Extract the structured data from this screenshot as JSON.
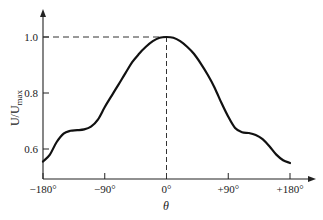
{
  "chart_data": {
    "type": "line",
    "title": "",
    "xlabel": "θ",
    "ylabel": "U/U",
    "ylabel_subscript": "max",
    "xlim": [
      -180,
      180
    ],
    "ylim": [
      0.5,
      1.05
    ],
    "grid": false,
    "legend": null,
    "x_ticks": [
      -180,
      -90,
      0,
      90,
      180
    ],
    "x_tick_labels": [
      "−180°",
      "−90°",
      "0°",
      "+90°",
      "+180°"
    ],
    "y_ticks": [
      0.6,
      0.8,
      1.0
    ],
    "y_tick_labels": [
      "0.6",
      "0.8",
      "1.0"
    ],
    "annotations": [
      {
        "type": "dashed-hline",
        "y": 1.0,
        "from_x": -180,
        "to_x": 0
      },
      {
        "type": "dashed-vline",
        "x": 0,
        "from_y": 0.5,
        "to_y": 1.0
      }
    ],
    "series": [
      {
        "name": "U/Umax",
        "x": [
          -180,
          -170,
          -160,
          -150,
          -140,
          -130,
          -120,
          -110,
          -100,
          -90,
          -80,
          -70,
          -60,
          -50,
          -40,
          -30,
          -20,
          -10,
          0,
          10,
          20,
          30,
          40,
          50,
          60,
          70,
          80,
          90,
          100,
          110,
          120,
          130,
          140,
          150,
          160,
          170,
          180
        ],
        "values": [
          0.555,
          0.58,
          0.625,
          0.655,
          0.665,
          0.667,
          0.67,
          0.68,
          0.705,
          0.75,
          0.79,
          0.83,
          0.87,
          0.91,
          0.94,
          0.965,
          0.985,
          0.997,
          1.0,
          0.997,
          0.985,
          0.965,
          0.94,
          0.905,
          0.865,
          0.82,
          0.765,
          0.715,
          0.675,
          0.66,
          0.657,
          0.65,
          0.635,
          0.61,
          0.58,
          0.56,
          0.55
        ]
      }
    ]
  }
}
